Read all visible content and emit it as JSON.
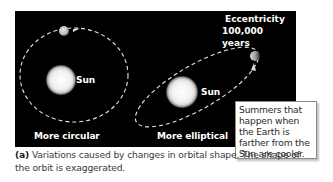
{
  "figure": {
    "panel_background": "#000000",
    "orbits": {
      "circular": {
        "label": "More circular",
        "sun_label": "Sun"
      },
      "elliptical": {
        "label": "More elliptical",
        "sun_label": "Sun"
      }
    },
    "cycle": {
      "title": "Eccentricity",
      "period": "100,000 years"
    },
    "callout": {
      "text": "Summers that happen when the Earth is farther from the Sun are cooler."
    },
    "caption": {
      "tag": "(a)",
      "text": " Variations caused by changes in orbital shape. The shape of the orbit is exaggerated."
    }
  }
}
